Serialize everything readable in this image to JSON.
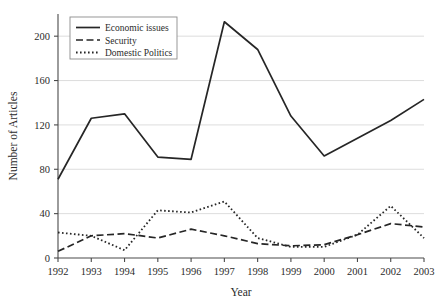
{
  "chart_data": {
    "type": "line",
    "title": "",
    "xlabel": "Year",
    "ylabel": "Number of Articles",
    "categories": [
      "1992",
      "1993",
      "1994",
      "1995",
      "1996",
      "1997",
      "1998",
      "1999",
      "2000",
      "2001",
      "2002",
      "2003"
    ],
    "x": [
      1992,
      1993,
      1994,
      1995,
      1996,
      1997,
      1998,
      1999,
      2000,
      2001,
      2002,
      2003
    ],
    "xlim": [
      1992,
      2003
    ],
    "ylim": [
      0,
      220
    ],
    "yticks": [
      0,
      40,
      80,
      120,
      160,
      200
    ],
    "ytick_labels": [
      "0",
      "40",
      "80",
      "120",
      "160",
      "200"
    ],
    "grid": "horizontal",
    "legend_position": "top-left",
    "series": [
      {
        "name": "Economic issues",
        "style": "solid",
        "color": "#262626",
        "values": [
          71,
          126,
          130,
          91,
          89,
          213,
          188,
          128,
          92,
          108,
          124,
          143
        ]
      },
      {
        "name": "Security",
        "style": "dashed",
        "color": "#262626",
        "values": [
          6,
          20,
          22,
          18,
          26,
          20,
          13,
          11,
          12,
          21,
          31,
          28
        ]
      },
      {
        "name": "Domestic Politics",
        "style": "dotted",
        "color": "#262626",
        "values": [
          23,
          20,
          7,
          43,
          41,
          51,
          18,
          10,
          10,
          21,
          47,
          18
        ]
      }
    ]
  },
  "legend": {
    "entries": [
      {
        "label": "Economic issues"
      },
      {
        "label": "Security"
      },
      {
        "label": "Domestic Politics"
      }
    ]
  }
}
